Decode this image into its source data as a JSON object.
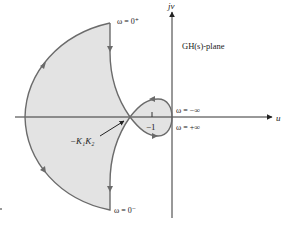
{
  "plane_label": "GH(s)-plane",
  "axes": {
    "horizontal_label": "u",
    "vertical_label": "jv"
  },
  "point_labels": {
    "omega_zero_plus": "ω = 0⁺",
    "omega_zero_minus": "ω = 0⁻",
    "omega_minus_inf": "ω = −∞",
    "omega_plus_inf": "ω = +∞",
    "minus_one": "−1",
    "gain_point": "−K₁K₂"
  },
  "colors": {
    "curve": "#6b6b6b",
    "fill": "#e3e3e3",
    "axis": "#333333",
    "text": "#222222",
    "background": "#ffffff"
  }
}
